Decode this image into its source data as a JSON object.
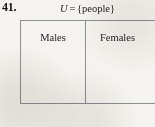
{
  "exercise": {
    "number": "41."
  },
  "caption": {
    "universe_symbol": "U",
    "equals": "=",
    "set_definition": "{people}"
  },
  "diagram": {
    "cells": [
      {
        "label": "Males"
      },
      {
        "label": "Females"
      }
    ]
  },
  "colors": {
    "page_background": "#f5f3ef",
    "rule": "#8b8e93",
    "text": "#25252a",
    "number_text": "#17171a"
  }
}
